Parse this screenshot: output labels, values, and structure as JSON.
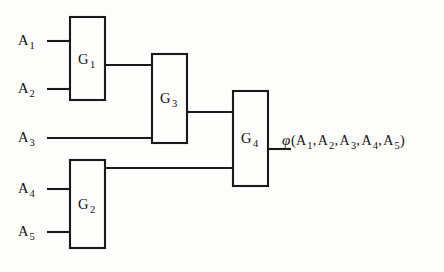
{
  "diagram": {
    "ink_color": "#1a1a1a",
    "background_color": "#fdfdfc",
    "inputs": [
      {
        "base": "A",
        "sub": "1",
        "id": "A1"
      },
      {
        "base": "A",
        "sub": "2",
        "id": "A2"
      },
      {
        "base": "A",
        "sub": "3",
        "id": "A3"
      },
      {
        "base": "A",
        "sub": "4",
        "id": "A4"
      },
      {
        "base": "A",
        "sub": "5",
        "id": "A5"
      }
    ],
    "gates": [
      {
        "base": "G",
        "sub": "1",
        "id": "G1"
      },
      {
        "base": "G",
        "sub": "2",
        "id": "G2"
      },
      {
        "base": "G",
        "sub": "3",
        "id": "G3"
      },
      {
        "base": "G",
        "sub": "4",
        "id": "G4"
      }
    ],
    "output": {
      "function_symbol": "φ",
      "open_paren": "(",
      "close_paren": ")",
      "separator": ",",
      "args": [
        {
          "base": "A",
          "sub": "1"
        },
        {
          "base": "A",
          "sub": "2"
        },
        {
          "base": "A",
          "sub": "3"
        },
        {
          "base": "A",
          "sub": "4"
        },
        {
          "base": "A",
          "sub": "5"
        }
      ],
      "full_text": "φ( A1, A2, A3, A4, A5 )"
    }
  }
}
